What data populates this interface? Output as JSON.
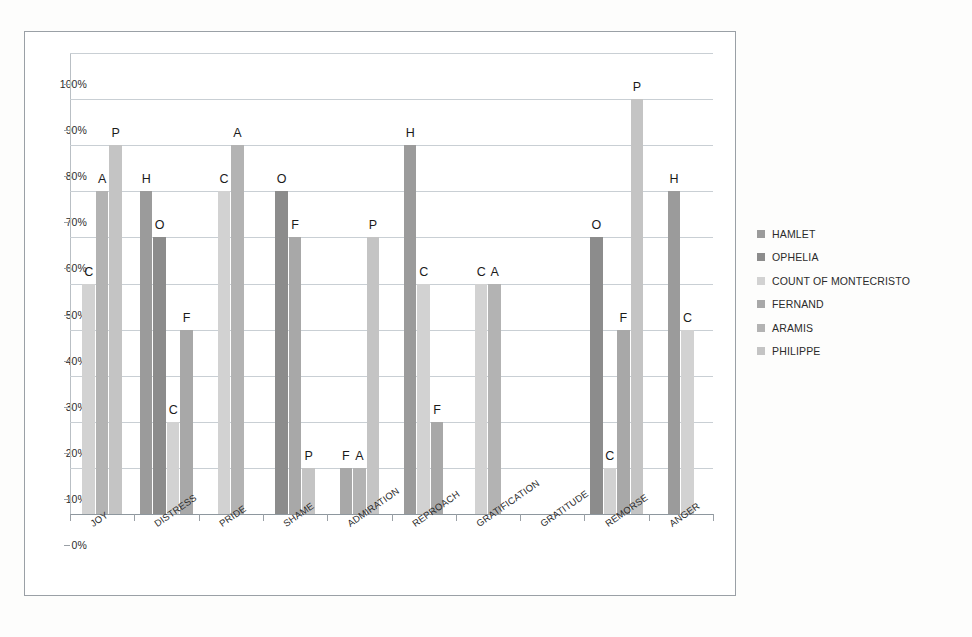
{
  "chart_data": {
    "type": "bar",
    "title": "",
    "subtitle": "",
    "xlabel": "",
    "ylabel": "",
    "ylim": [
      0,
      100
    ],
    "ytick_labels": [
      "0%",
      "10%",
      "20%",
      "30%",
      "40%",
      "50%",
      "60%",
      "70%",
      "80%",
      "90%",
      "100%"
    ],
    "ytick_values": [
      0,
      10,
      20,
      30,
      40,
      50,
      60,
      70,
      80,
      90,
      100
    ],
    "grid": true,
    "legend_position": "right",
    "categories": [
      "JOY",
      "DISTRESS",
      "PRIDE",
      "SHAME",
      "ADMIRATION",
      "REPROACH",
      "GRATIFICATION",
      "GRATITUDE",
      "REMORSE",
      "ANGER"
    ],
    "series": [
      {
        "name": "HAMLET",
        "initial": "H",
        "color": "#9b9b9b",
        "values": [
          0,
          70,
          0,
          0,
          0,
          80,
          0,
          0,
          0,
          70
        ]
      },
      {
        "name": "OPHELIA",
        "initial": "O",
        "color": "#8c8c8c",
        "values": [
          0,
          60,
          0,
          70,
          0,
          0,
          0,
          0,
          60,
          0
        ]
      },
      {
        "name": "COUNT OF MONTECRISTO",
        "initial": "C",
        "color": "#d2d2d2",
        "values": [
          50,
          20,
          70,
          0,
          0,
          50,
          50,
          0,
          10,
          40
        ]
      },
      {
        "name": "FERNAND",
        "initial": "F",
        "color": "#a8a8a8",
        "values": [
          0,
          40,
          0,
          60,
          10,
          20,
          0,
          0,
          40,
          0
        ]
      },
      {
        "name": "ARAMIS",
        "initial": "A",
        "color": "#b3b3b3",
        "values": [
          70,
          0,
          80,
          0,
          10,
          0,
          50,
          0,
          0,
          0
        ]
      },
      {
        "name": "PHILIPPE",
        "initial": "P",
        "color": "#c4c4c4",
        "values": [
          80,
          0,
          0,
          10,
          60,
          0,
          0,
          0,
          90,
          0
        ]
      }
    ],
    "bar_labels_are_series_initials": true
  },
  "legend": {
    "items": [
      {
        "label": "HAMLET",
        "color": "#9b9b9b"
      },
      {
        "label": "OPHELIA",
        "color": "#8c8c8c"
      },
      {
        "label": "COUNT OF MONTECRISTO",
        "color": "#d2d2d2"
      },
      {
        "label": "FERNAND",
        "color": "#a8a8a8"
      },
      {
        "label": "ARAMIS",
        "color": "#b3b3b3"
      },
      {
        "label": "PHILIPPE",
        "color": "#c4c4c4"
      }
    ]
  }
}
